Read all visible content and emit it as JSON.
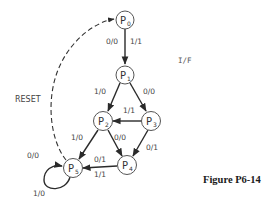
{
  "figure": {
    "caption": "Figure P6-14",
    "legend": "I/F",
    "reset_label": "RESET"
  },
  "states": [
    {
      "id": "P0",
      "letter": "P",
      "sub": "0",
      "cx": 125,
      "cy": 20
    },
    {
      "id": "P1",
      "letter": "P",
      "sub": "1",
      "cx": 125,
      "cy": 75
    },
    {
      "id": "P2",
      "letter": "P",
      "sub": "2",
      "cx": 103,
      "cy": 121
    },
    {
      "id": "P3",
      "letter": "P",
      "sub": "3",
      "cx": 151,
      "cy": 121
    },
    {
      "id": "P4",
      "letter": "P",
      "sub": "4",
      "cx": 127,
      "cy": 165
    },
    {
      "id": "P5",
      "letter": "P",
      "sub": "5",
      "cx": 73,
      "cy": 168
    }
  ],
  "transitions": [
    {
      "from": "P0",
      "to": "P1",
      "labels": [
        "0/0",
        "1/1"
      ]
    },
    {
      "from": "P1",
      "to": "P2",
      "labels": [
        "1/0"
      ]
    },
    {
      "from": "P1",
      "to": "P3",
      "labels": [
        "0/0"
      ]
    },
    {
      "from": "P3",
      "to": "P2",
      "labels": [
        "1/1"
      ]
    },
    {
      "from": "P2",
      "to": "P5",
      "labels": [
        "1/0"
      ]
    },
    {
      "from": "P2",
      "to": "P4",
      "labels": [
        "0/0"
      ]
    },
    {
      "from": "P3",
      "to": "P4",
      "labels": [
        "0/1"
      ]
    },
    {
      "from": "P4",
      "to": "P5",
      "labels": [
        "0/1",
        "1/1"
      ]
    },
    {
      "from": "P5",
      "to": "P5",
      "labels": [
        "1/0"
      ]
    },
    {
      "from": "P5",
      "to": "P0",
      "labels": [
        "0/0"
      ],
      "style": "dashed",
      "note": "RESET"
    }
  ],
  "edge_labels": {
    "p0_p1_left": "0/0",
    "p0_p1_right": "1/1",
    "p1_p2": "1/0",
    "p1_p3": "0/0",
    "p3_p2": "1/1",
    "p2_p5": "1/0",
    "p2_p4": "0/0",
    "p3_p4": "0/1",
    "p4_p5_top": "0/1",
    "p4_p5_bottom": "1/1",
    "p5_p0": "0/0",
    "p5_self": "1/0"
  }
}
